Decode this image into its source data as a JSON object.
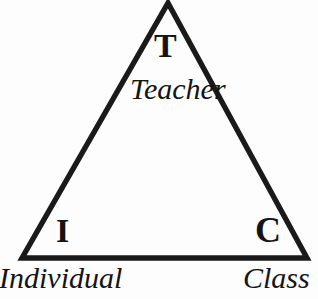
{
  "diagram": {
    "type": "triangle-framework",
    "title": "",
    "background_color": "#fdfdfd",
    "stroke_color": "#1a1a1a",
    "stroke_width_px": 5,
    "vertices": [
      {
        "id": "top",
        "letter": "T",
        "word": "Teacher",
        "x": 168,
        "y": 3
      },
      {
        "id": "bottom-left",
        "letter": "I",
        "word": "Individual",
        "x": 22,
        "y": 258
      },
      {
        "id": "bottom-right",
        "letter": "C",
        "word": "Class",
        "x": 307,
        "y": 258
      }
    ],
    "labels": {
      "top_letter": "T",
      "top_word": "Teacher",
      "left_letter": "I",
      "left_word": "Individual",
      "right_letter": "C",
      "right_word": "Class"
    }
  }
}
